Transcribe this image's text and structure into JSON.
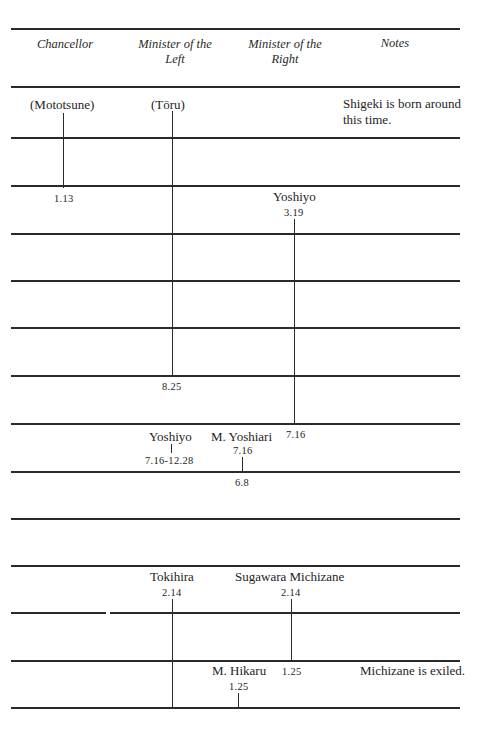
{
  "table": {
    "headers": {
      "chancellor": "Chancellor",
      "left_1": "Minister of the",
      "left_2": "Left",
      "right_1": "Minister of the",
      "right_2": "Right",
      "notes": "Notes"
    },
    "chancellor": {
      "mototsune": "(Mototsune)",
      "mototsune_end": "1.13"
    },
    "minister_left": {
      "toru": "(Tōru)",
      "toru_end": "8.25",
      "yoshiyo": "Yoshiyo",
      "yoshiyo_dates": "7.16-12.28",
      "tokihira": "Tokihira",
      "tokihira_start": "2.14"
    },
    "minister_right": {
      "yoshiyo": "Yoshiyo",
      "yoshiyo_start": "3.19",
      "yoshiyo_end": "7.16",
      "yoshiari": "M. Yoshiari",
      "yoshiari_start": "7.16",
      "yoshiari_end": "6.8",
      "michizane": "Sugawara Michizane",
      "michizane_start": "2.14",
      "michizane_end": "1.25",
      "hikaru": "M. Hikaru",
      "hikaru_start": "1.25"
    },
    "notes": {
      "note_1_line1": "Shigeki is born around",
      "note_1_line2": "this time.",
      "note_2": "Michizane is exiled."
    }
  }
}
